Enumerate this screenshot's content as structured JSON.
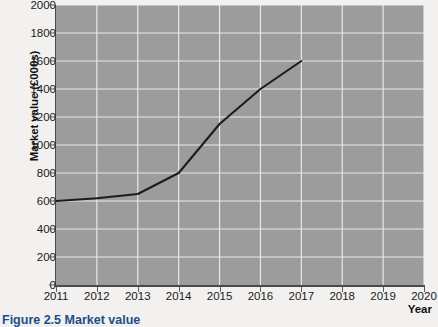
{
  "chart_data": {
    "type": "line",
    "title": "",
    "xlabel": "Year",
    "ylabel": "Market value (£000s)",
    "x": [
      2011,
      2012,
      2013,
      2014,
      2015,
      2016,
      2017
    ],
    "values": [
      600,
      620,
      650,
      800,
      1150,
      1400,
      1600
    ],
    "series": [
      {
        "name": "Market value",
        "values": [
          600,
          620,
          650,
          800,
          1150,
          1400,
          1600
        ]
      }
    ],
    "xlim": [
      2011,
      2020
    ],
    "ylim": [
      0,
      2000
    ],
    "xticks": [
      2011,
      2012,
      2013,
      2014,
      2015,
      2016,
      2017,
      2018,
      2019,
      2020
    ],
    "yticks": [
      0,
      200,
      400,
      600,
      800,
      1000,
      1200,
      1400,
      1600,
      1800,
      2000
    ],
    "xtick_labels": [
      "2011",
      "2012",
      "2013",
      "2014",
      "2015",
      "2016",
      "2017",
      "2018",
      "2019",
      "2020"
    ],
    "ytick_labels": [
      "0",
      "200",
      "400",
      "600",
      "800",
      "1000",
      "1200",
      "1400",
      "1600",
      "1800",
      "2000"
    ],
    "grid": true,
    "grid_color": "#e8e8e8",
    "plot_background": "#9c9c9c",
    "line_color": "#1c1c1c",
    "legend": null,
    "legend_position": "none"
  },
  "figure": {
    "caption": "Figure 2.5 Market value"
  }
}
